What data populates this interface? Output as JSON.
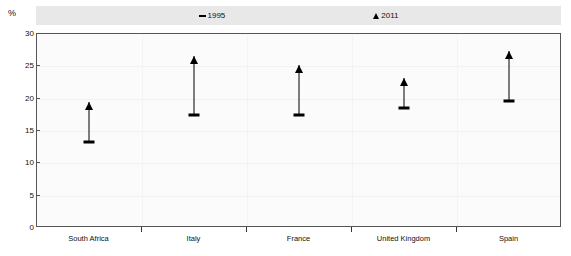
{
  "unit_label": "%",
  "chart_data": {
    "type": "scatter",
    "title": "",
    "subtitle": "",
    "xlabel": "",
    "ylabel": "%",
    "ylim": [
      0,
      30
    ],
    "yticks": [
      0,
      5,
      10,
      15,
      20,
      25,
      30
    ],
    "grid": true,
    "legend_position": "top",
    "categories": [
      "South Africa",
      "Italy",
      "France",
      "United Kingdom",
      "Spain"
    ],
    "series": [
      {
        "name": "1995",
        "marker": "dash",
        "color": "#000000",
        "values": [
          13.1,
          17.3,
          17.3,
          18.4,
          19.5
        ]
      },
      {
        "name": "2011",
        "marker": "triangle-up",
        "color": "#000000",
        "values": [
          19.4,
          26.5,
          25.0,
          23.0,
          27.2
        ]
      }
    ]
  }
}
